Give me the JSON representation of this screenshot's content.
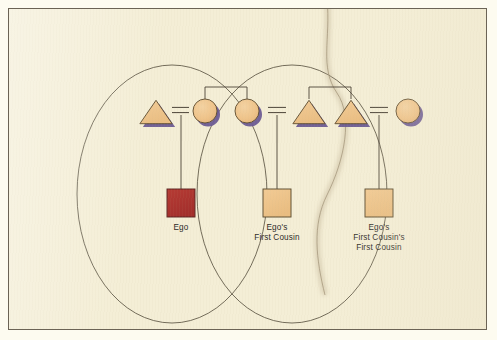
{
  "figure": {
    "kind": "kinship-diagram",
    "background_color": "#f4eed6",
    "frame_color": "#6b6355",
    "outline_color": "#4a4237",
    "kindred_outline_color": "#57503f"
  },
  "palette": {
    "shape_fill": "#efc48b",
    "shape_stroke": "#5a4a2e",
    "shape_shadow": "#6b5a93",
    "ego_fill": "#ae3531",
    "ego_stroke": "#5a2320",
    "line_color": "#4a4237",
    "text_color": "#2c2a27"
  },
  "kindreds": [
    {
      "id": "ego-kindred",
      "name": "ego-kindred-ellipse",
      "cx": 163,
      "cy": 185,
      "rx": 95,
      "ry": 129
    },
    {
      "id": "cousin-kindred",
      "name": "cousin-kindred-ellipse",
      "cx": 283,
      "cy": 185,
      "rx": 95,
      "ry": 129
    }
  ],
  "symbols": [
    {
      "id": "s1",
      "name": "male-ego-father",
      "shape": "triangle",
      "cx": 147,
      "cy": 103,
      "size": 26
    },
    {
      "id": "s2",
      "name": "female-ego-mother",
      "shape": "circle",
      "cx": 196,
      "cy": 102,
      "size": 24
    },
    {
      "id": "s3",
      "name": "female-ego-mothers-sister",
      "shape": "circle",
      "cx": 238,
      "cy": 102,
      "size": 24
    },
    {
      "id": "s4",
      "name": "male-first-cousins-father",
      "shape": "triangle",
      "cx": 300,
      "cy": 103,
      "size": 26
    },
    {
      "id": "s5",
      "name": "male-first-cousins-uncle",
      "shape": "triangle",
      "cx": 342,
      "cy": 103,
      "size": 26
    },
    {
      "id": "s6",
      "name": "female-second-cousin-mother",
      "shape": "circle",
      "cx": 399,
      "cy": 102,
      "size": 24
    }
  ],
  "descendants": [
    {
      "id": "d1",
      "name": "ego-square",
      "cx": 172,
      "cy": 194,
      "size": 28,
      "highlighted": true,
      "label": "Ego",
      "label_lines": [
        "Ego"
      ],
      "label_x": 172,
      "label_y": 214
    },
    {
      "id": "d2",
      "name": "ego-first-cousin-square",
      "cx": 268,
      "cy": 194,
      "size": 28,
      "highlighted": false,
      "label": "Ego's First Cousin",
      "label_lines": [
        "Ego's",
        "First Cousin"
      ],
      "label_x": 268,
      "label_y": 214
    },
    {
      "id": "d3",
      "name": "ego-first-cousins-first-cousin-square",
      "cx": 370,
      "cy": 194,
      "size": 28,
      "highlighted": false,
      "label": "Ego's First Cousin's First Cousin",
      "label_lines": [
        "Ego's",
        "First Cousin's",
        "First Cousin"
      ],
      "label_x": 370,
      "label_y": 214
    }
  ],
  "marriage_links": [
    {
      "id": "m1",
      "name": "marriage-link-ego-parents",
      "x1": 163,
      "x2": 180,
      "y": 101,
      "descent_x": 172,
      "descent_y1": 106,
      "descent_y2": 180
    },
    {
      "id": "m2",
      "name": "marriage-link-cousin-parents",
      "x1": 259,
      "x2": 277,
      "y": 101,
      "descent_x": 268,
      "descent_y1": 106,
      "descent_y2": 180
    },
    {
      "id": "m3",
      "name": "marriage-link-second-cousin-parents",
      "x1": 361,
      "x2": 379,
      "y": 101,
      "descent_x": 370,
      "descent_y1": 106,
      "descent_y2": 180
    }
  ],
  "sibling_links": [
    {
      "id": "sb1",
      "name": "sibling-bracket-mothers",
      "x1": 196,
      "x2": 238,
      "y": 78,
      "drop": 12
    },
    {
      "id": "sb2",
      "name": "sibling-bracket-uncles",
      "x1": 300,
      "x2": 342,
      "y": 78,
      "drop": 12
    }
  ],
  "artifacts": [
    {
      "id": "a1",
      "name": "scan-hair-artifact",
      "description": "stray hair or thread on scanner glass with soft shadow"
    }
  ]
}
